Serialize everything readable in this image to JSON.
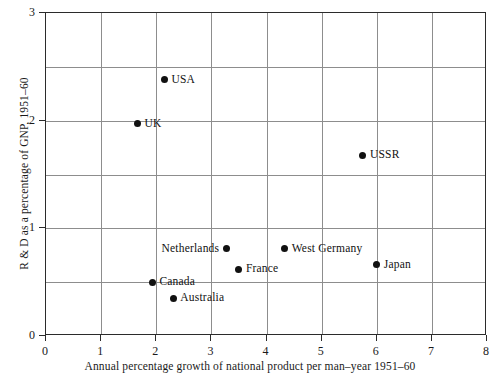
{
  "chart_data": {
    "type": "scatter",
    "title": "",
    "xlabel": "Annual percentage growth of national product per man–year 1951–60",
    "ylabel": "R & D as a percentage of GNP, 1951–60",
    "xlim": [
      0,
      8
    ],
    "ylim": [
      0,
      3
    ],
    "xticks": [
      "0",
      "1",
      "2",
      "3",
      "4",
      "5",
      "6",
      "7",
      "8"
    ],
    "xtick_values": [
      0,
      1,
      2,
      3,
      4,
      5,
      6,
      7,
      8
    ],
    "yticks": [
      "0",
      "1",
      "2",
      "3"
    ],
    "ytick_values": [
      0,
      1,
      2,
      3
    ],
    "grid": true,
    "grid_x_values": [
      0,
      1,
      2,
      3,
      4,
      5,
      6,
      7,
      8
    ],
    "grid_y_values": [
      0,
      0.5,
      1,
      1.5,
      2,
      2.5,
      3
    ],
    "legend": "none",
    "marker": "filled-circle",
    "marker_color": "#111111",
    "grid_color": "#8d8d8d",
    "frame_color": "#2b2b2b",
    "points": [
      {
        "label": "USA",
        "x": 2.15,
        "y": 2.38,
        "label_side": "right"
      },
      {
        "label": "UK",
        "x": 1.66,
        "y": 1.97,
        "label_side": "right"
      },
      {
        "label": "USSR",
        "x": 5.75,
        "y": 1.68,
        "label_side": "right"
      },
      {
        "label": "Netherlands",
        "x": 3.27,
        "y": 0.81,
        "label_side": "left"
      },
      {
        "label": "West Germany",
        "x": 4.33,
        "y": 0.81,
        "label_side": "right"
      },
      {
        "label": "France",
        "x": 3.5,
        "y": 0.62,
        "label_side": "right"
      },
      {
        "label": "Japan",
        "x": 6.0,
        "y": 0.66,
        "label_side": "right"
      },
      {
        "label": "Canada",
        "x": 1.93,
        "y": 0.5,
        "label_side": "right"
      },
      {
        "label": "Australia",
        "x": 2.31,
        "y": 0.35,
        "label_side": "right"
      }
    ]
  }
}
